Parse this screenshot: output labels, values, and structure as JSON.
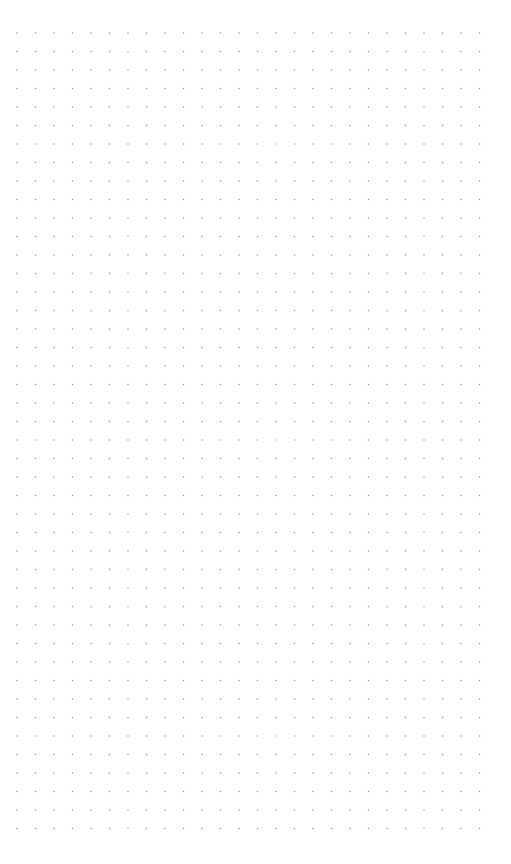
{
  "canvas": {
    "background": "#ffffff",
    "dot_color": "#9a9a9a",
    "dot_radius": 0.8,
    "origin_x": 17,
    "origin_y": 33,
    "spacing": 18.5,
    "columns": 26,
    "rows": 44
  }
}
